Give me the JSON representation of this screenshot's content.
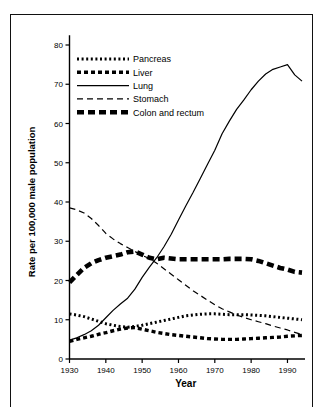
{
  "figure": {
    "background_color": "#ffffff",
    "frame_color": "#111111",
    "ink_color": "#000000"
  },
  "chart_data": {
    "type": "line",
    "title": "",
    "subtitle": "",
    "xlabel": "Year",
    "ylabel": "Rate per 100,000 male population",
    "xlim": [
      1930,
      1994
    ],
    "ylim": [
      0,
      82
    ],
    "xticks": [
      1930,
      1940,
      1950,
      1960,
      1970,
      1980,
      1990
    ],
    "xticklabels": [
      "1930",
      "1940",
      "1950",
      "1960",
      "1970",
      "1980",
      "1990"
    ],
    "yticks": [
      0,
      10,
      20,
      30,
      40,
      50,
      60,
      70,
      80
    ],
    "yticklabels": [
      "0",
      "10",
      "20",
      "30",
      "40",
      "50",
      "60",
      "70",
      "80"
    ],
    "grid": false,
    "legend_position": "upper-left-inside",
    "x": [
      1930,
      1932,
      1934,
      1936,
      1938,
      1940,
      1942,
      1944,
      1946,
      1948,
      1950,
      1952,
      1954,
      1956,
      1958,
      1960,
      1962,
      1964,
      1966,
      1968,
      1970,
      1972,
      1974,
      1976,
      1978,
      1980,
      1982,
      1984,
      1986,
      1988,
      1990,
      1992,
      1994
    ],
    "series": [
      {
        "name": "Pancreas",
        "style": "dotted-fine",
        "stroke_width": 3.0,
        "dash": "2,2.6",
        "values": [
          11.5,
          11.2,
          10.8,
          10.2,
          9.6,
          9.0,
          8.6,
          8.3,
          8.1,
          8.3,
          8.6,
          9.0,
          9.4,
          9.8,
          10.2,
          10.6,
          11.0,
          11.2,
          11.4,
          11.5,
          11.5,
          11.4,
          11.3,
          11.3,
          11.3,
          11.2,
          11.1,
          11.0,
          10.8,
          10.6,
          10.4,
          10.2,
          10.0
        ]
      },
      {
        "name": "Liver",
        "style": "dashed-medium",
        "stroke_width": 3.4,
        "dash": "4,3",
        "values": [
          4.5,
          5.0,
          5.4,
          5.8,
          6.3,
          6.7,
          7.2,
          7.6,
          7.9,
          8.0,
          7.6,
          7.2,
          6.8,
          6.5,
          6.2,
          6.0,
          5.8,
          5.6,
          5.4,
          5.2,
          5.1,
          5.0,
          5.0,
          5.0,
          5.1,
          5.2,
          5.3,
          5.4,
          5.5,
          5.6,
          5.8,
          5.9,
          6.0
        ]
      },
      {
        "name": "Lung",
        "style": "solid",
        "stroke_width": 1.2,
        "dash": "none",
        "values": [
          4.8,
          5.4,
          6.2,
          7.2,
          8.6,
          10.5,
          12.4,
          14.0,
          15.5,
          17.8,
          20.8,
          23.4,
          25.8,
          28.6,
          31.8,
          35.4,
          39.0,
          42.4,
          46.0,
          49.6,
          53.2,
          57.4,
          60.6,
          63.6,
          66.0,
          68.6,
          70.8,
          72.6,
          73.8,
          74.4,
          75.0,
          72.4,
          70.8
        ]
      },
      {
        "name": "Stomach",
        "style": "dashed-long",
        "stroke_width": 1.2,
        "dash": "6,4",
        "values": [
          38.5,
          38.0,
          37.2,
          35.8,
          34.0,
          32.0,
          30.6,
          29.4,
          28.4,
          27.4,
          26.4,
          25.6,
          24.4,
          23.0,
          21.6,
          20.2,
          18.8,
          17.4,
          16.2,
          15.0,
          13.8,
          12.8,
          12.0,
          11.2,
          10.6,
          10.0,
          9.5,
          9.0,
          8.4,
          7.9,
          7.4,
          6.8,
          6.2
        ]
      },
      {
        "name": "Colon and rectum",
        "style": "dashed-thick",
        "stroke_width": 4.6,
        "dash": "7,4",
        "values": [
          19.5,
          21.4,
          23.2,
          24.4,
          25.2,
          25.8,
          26.2,
          26.6,
          27.2,
          27.4,
          26.6,
          25.8,
          25.4,
          25.8,
          25.6,
          25.4,
          25.4,
          25.4,
          25.4,
          25.4,
          25.4,
          25.4,
          25.5,
          25.5,
          25.5,
          25.4,
          25.0,
          24.4,
          23.8,
          23.2,
          22.8,
          22.2,
          22.0
        ]
      }
    ],
    "legend": [
      {
        "label": "Pancreas",
        "style": "dotted-fine"
      },
      {
        "label": "Liver",
        "style": "dashed-medium"
      },
      {
        "label": "Lung",
        "style": "solid"
      },
      {
        "label": "Stomach",
        "style": "dashed-long"
      },
      {
        "label": "Colon and rectum",
        "style": "dashed-thick"
      }
    ]
  }
}
